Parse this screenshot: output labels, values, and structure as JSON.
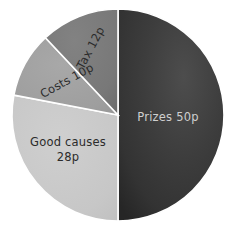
{
  "chart_data": {
    "type": "pie",
    "title": "",
    "subtitle": "",
    "xlabel": "",
    "ylabel": "",
    "legend_position": "none",
    "grid": false,
    "unit": "p",
    "total": 100,
    "categories": [
      "Prizes",
      "Good causes",
      "Tax",
      "Costs"
    ],
    "values": [
      50,
      28,
      12,
      10
    ],
    "slices": [
      {
        "name": "Prizes",
        "value": 50,
        "label": "Prizes 50p",
        "color": "#3a3a3a",
        "label_color": "#cfcfcf",
        "label_rotation": 0,
        "label_x": 168,
        "label_y": 117,
        "start_angle": 0,
        "end_angle": 180
      },
      {
        "name": "Good causes",
        "value": 28,
        "label_line1": "Good causes",
        "label_line2": "28p",
        "color": "#c8c8c8",
        "label_color": "#2b2b2b",
        "label_rotation": 0,
        "label_x": 68,
        "label_y": 149,
        "start_angle": 180,
        "end_angle": 280.8
      },
      {
        "name": "Costs",
        "value": 10,
        "label": "Costs 10p",
        "color": "#a0a0a0",
        "label_color": "#2b2b2b",
        "label_rotation": -29,
        "label_x": 67,
        "label_y": 81,
        "start_angle": 280.8,
        "end_angle": 316.8
      },
      {
        "name": "Tax",
        "value": 12,
        "label": "Tax 12p",
        "color": "#787878",
        "label_color": "#2b2b2b",
        "label_rotation": -62,
        "label_x": 91,
        "label_y": 48,
        "start_angle": 316.8,
        "end_angle": 360
      }
    ],
    "geometry": {
      "center_x": 118,
      "center_y": 115,
      "radius": 106
    },
    "background_color": "#ffffff",
    "separator_color": "#ffffff"
  }
}
